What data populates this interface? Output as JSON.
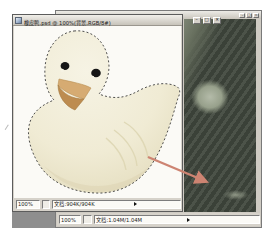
{
  "doc_window": {
    "title": "橡皮鸭.psd @ 100%(背景,RGB/8#)",
    "controls": {
      "minimize": "–",
      "maximize": "□",
      "close": "×"
    },
    "statusbar": {
      "zoom": "100%",
      "doc_info": "文档:904K/904K"
    }
  },
  "target_window": {
    "controls": {
      "minimize": "–",
      "maximize": "□",
      "close": "×"
    },
    "statusbar": {
      "zoom": "100%",
      "doc_info": "文档:1.04M/1.04M"
    }
  },
  "colors": {
    "arrow": "#cd8472",
    "duck_body": "#f3efdc",
    "duck_shade": "#e3dcbd",
    "duck_beak_upper": "#d6ab72",
    "duck_beak_lower": "#bd8c50",
    "selection_ants": "#3c3c3c",
    "target_image_dark": "#41483e",
    "workspace": "#8e8e8e"
  }
}
